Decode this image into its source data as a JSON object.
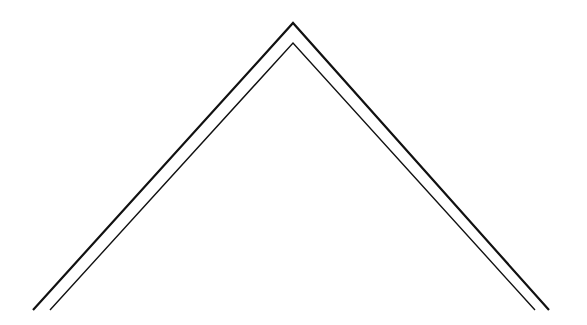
{
  "figure": {
    "background": "#ffffff",
    "stroke_color": "#111111",
    "outer_chevron": {
      "apex": [
        293,
        23
      ],
      "left_end": [
        33,
        310
      ],
      "right_end": [
        549,
        310
      ],
      "stroke_width": 2.2
    },
    "inner_chevron": {
      "apex": [
        293,
        43
      ],
      "left_end": [
        50,
        310
      ],
      "right_end": [
        535,
        310
      ],
      "stroke_width": 1.4
    }
  }
}
